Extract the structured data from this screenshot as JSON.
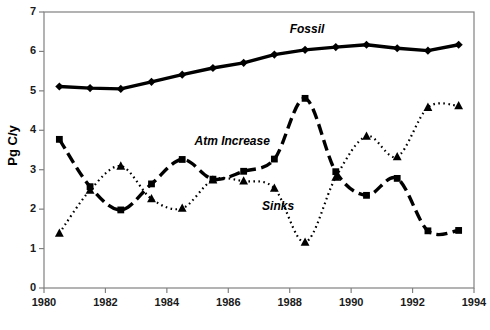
{
  "chart_data": {
    "type": "line",
    "title": "",
    "xlabel": "",
    "ylabel": "Pg C/y",
    "xlim": [
      1980,
      1994
    ],
    "ylim": [
      0,
      7
    ],
    "xticks": [
      1980,
      1982,
      1984,
      1986,
      1988,
      1990,
      1992,
      1994
    ],
    "xtick_labels": [
      "1980",
      "1982",
      "1984",
      "1986",
      "1988",
      "1990",
      "1992",
      "1994"
    ],
    "yticks": [
      0,
      1,
      2,
      3,
      4,
      5,
      6,
      7
    ],
    "ytick_labels": [
      "0",
      "1",
      "2",
      "3",
      "4",
      "5",
      "6",
      "7"
    ],
    "grid": false,
    "legend_position": "inline-annotations",
    "x": [
      1980.5,
      1981.5,
      1982.5,
      1983.5,
      1984.5,
      1985.5,
      1986.5,
      1987.5,
      1988.5,
      1989.5,
      1990.5,
      1991.5,
      1992.5,
      1993.5
    ],
    "series": [
      {
        "name": "Fossil",
        "marker": "diamond",
        "linestyle": "solid",
        "color": "#000000",
        "values": [
          5.11,
          5.07,
          5.05,
          5.23,
          5.41,
          5.58,
          5.71,
          5.92,
          6.04,
          6.11,
          6.17,
          6.08,
          6.02,
          6.17
        ]
      },
      {
        "name": "Atm Increase",
        "marker": "square",
        "linestyle": "dashed",
        "color": "#000000",
        "values": [
          3.77,
          2.57,
          1.98,
          2.64,
          3.26,
          2.76,
          2.96,
          3.27,
          4.81,
          2.95,
          2.35,
          2.78,
          1.45,
          1.46
        ]
      },
      {
        "name": "Sinks",
        "marker": "triangle",
        "linestyle": "dotted",
        "color": "#000000",
        "values": [
          1.39,
          2.48,
          3.09,
          2.26,
          2.02,
          2.74,
          2.71,
          2.53,
          1.16,
          2.81,
          3.85,
          3.33,
          4.58,
          4.62
        ]
      }
    ],
    "annotations": [
      {
        "text": "Fossil",
        "x": 1988.0,
        "y": 6.55
      },
      {
        "text": "Atm Increase",
        "x": 1984.9,
        "y": 3.7
      },
      {
        "text": "Sinks",
        "x": 1987.1,
        "y": 2.05
      }
    ]
  },
  "axis": {
    "frame_color": "#808080",
    "line_color": "#000000"
  }
}
